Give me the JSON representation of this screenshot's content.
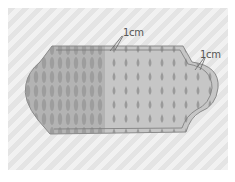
{
  "figure": {
    "annotations": [
      {
        "id": "top",
        "text": "1cm",
        "x": 124,
        "y": 28
      },
      {
        "id": "right",
        "text": "1cm",
        "x": 201,
        "y": 50
      }
    ],
    "colors": {
      "background_stripe_light": "#f1f1f1",
      "background_stripe_dark": "#e4e4e4",
      "fabric_left": "#b5b5b5",
      "fabric_right": "#c4c4c4",
      "drop_pattern": "#9a9a9a",
      "outline": "#8a8a8a"
    }
  }
}
